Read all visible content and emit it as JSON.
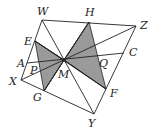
{
  "diagram": {
    "type": "geometry-figure",
    "colors": {
      "stroke": "#222222",
      "shade": "#9a9a9a",
      "background": "#ffffff"
    },
    "points": {
      "W": [
        42,
        20
      ],
      "H": [
        89,
        22
      ],
      "Z": [
        136,
        26
      ],
      "E": [
        35,
        41
      ],
      "A": [
        27,
        63
      ],
      "X": [
        21,
        80
      ],
      "G": [
        44,
        91
      ],
      "Y": [
        94,
        114
      ],
      "F": [
        106,
        89
      ],
      "C": [
        124,
        53
      ],
      "M": [
        64,
        60
      ],
      "P": [
        34,
        62
      ],
      "Q": [
        99,
        56
      ]
    },
    "labels": [
      {
        "text": "W",
        "x": 37,
        "y": 15
      },
      {
        "text": "H",
        "x": 85,
        "y": 16
      },
      {
        "text": "Z",
        "x": 140,
        "y": 29
      },
      {
        "text": "E",
        "x": 24,
        "y": 45
      },
      {
        "text": "C",
        "x": 129,
        "y": 56
      },
      {
        "text": "A",
        "x": 17,
        "y": 67
      },
      {
        "text": "P",
        "x": 30,
        "y": 74
      },
      {
        "text": "Q",
        "x": 99,
        "y": 67
      },
      {
        "text": "M",
        "x": 58,
        "y": 78
      },
      {
        "text": "X",
        "x": 9,
        "y": 85
      },
      {
        "text": "G",
        "x": 33,
        "y": 101
      },
      {
        "text": "F",
        "x": 110,
        "y": 97
      },
      {
        "text": "Y",
        "x": 88,
        "y": 127
      }
    ],
    "shaded_triangles": [
      [
        "E",
        "M",
        "G"
      ],
      [
        "H",
        "M",
        "F"
      ]
    ],
    "segments": [
      [
        "W",
        "Z"
      ],
      [
        "Z",
        "Y"
      ],
      [
        "Y",
        "X"
      ],
      [
        "X",
        "W"
      ],
      [
        "W",
        "Y"
      ],
      [
        "X",
        "Z"
      ],
      [
        "A",
        "C"
      ],
      [
        "E",
        "F"
      ],
      [
        "H",
        "G"
      ],
      [
        "E",
        "M"
      ],
      [
        "G",
        "M"
      ],
      [
        "H",
        "M"
      ],
      [
        "F",
        "M"
      ]
    ]
  }
}
